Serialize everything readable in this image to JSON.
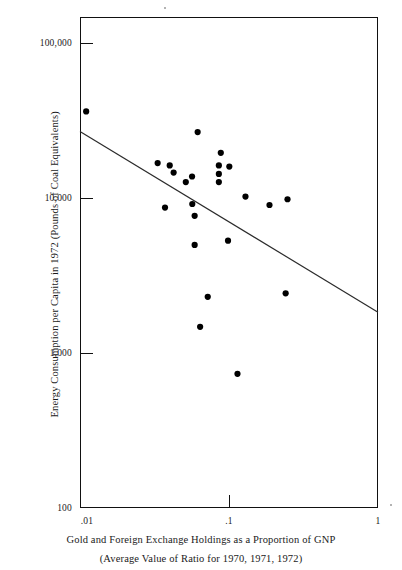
{
  "chart_data": {
    "type": "scatter",
    "title": "",
    "xlabel": "Gold and Foreign Exchange Holdings as a Proportion of GNP",
    "xlabel_line2": "(Average Value of Ratio for 1970, 1971, 1972)",
    "ylabel": "Energy Consumption per Capita in 1972 (Pounds of Coal Equivalents)",
    "xscale": "log",
    "yscale": "log",
    "xlim": [
      0.01,
      1
    ],
    "ylim": [
      100,
      100000
    ],
    "xtick_labels": [
      ".01",
      ".1",
      "1"
    ],
    "xtick_values": [
      0.01,
      0.1,
      1
    ],
    "ytick_labels": [
      "100,000",
      "10,000",
      "1,000",
      "100"
    ],
    "ytick_values": [
      100000,
      10000,
      1000,
      100
    ],
    "grid": false,
    "legend": false,
    "marker": "filled-circle",
    "marker_color": "#000000",
    "points": [
      {
        "x": 0.011,
        "y": 26500
      },
      {
        "x": 0.0616,
        "y": 19800
      },
      {
        "x": 0.0332,
        "y": 12800
      },
      {
        "x": 0.04,
        "y": 12400
      },
      {
        "x": 0.0425,
        "y": 11200
      },
      {
        "x": 0.0565,
        "y": 10600
      },
      {
        "x": 0.0513,
        "y": 9800
      },
      {
        "x": 0.0881,
        "y": 14800
      },
      {
        "x": 0.0855,
        "y": 12400
      },
      {
        "x": 0.1005,
        "y": 12200
      },
      {
        "x": 0.0855,
        "y": 11000
      },
      {
        "x": 0.0855,
        "y": 9800
      },
      {
        "x": 0.129,
        "y": 8000
      },
      {
        "x": 0.187,
        "y": 7100
      },
      {
        "x": 0.247,
        "y": 7700
      },
      {
        "x": 0.0372,
        "y": 6850
      },
      {
        "x": 0.0567,
        "y": 7200
      },
      {
        "x": 0.0588,
        "y": 6100
      },
      {
        "x": 0.0588,
        "y": 4050
      },
      {
        "x": 0.0985,
        "y": 4300
      },
      {
        "x": 0.072,
        "y": 1950
      },
      {
        "x": 0.24,
        "y": 2050
      },
      {
        "x": 0.064,
        "y": 1280
      },
      {
        "x": 0.114,
        "y": 660
      }
    ],
    "trendline": {
      "label": "fitted regression line",
      "x_start": 0.01,
      "y_start": 20000,
      "x_end": 1.0,
      "y_end": 1570
    },
    "n_points": 24
  },
  "figure": {
    "background_color": "#ffffff",
    "axis_color": "#111111",
    "marker_color": "#000000",
    "line_color": "#2b2b2b"
  }
}
